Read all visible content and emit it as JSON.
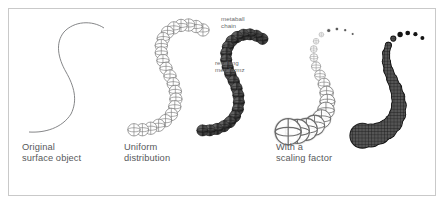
{
  "figure": {
    "background": "#ffffff",
    "border_color": "#c9c9c9",
    "ink": "#58595b",
    "dark_fill": "#3c3c3c",
    "halo": "#d8d8d8"
  },
  "captions": {
    "original": "Original\nsurface object",
    "uniform": "Uniform\ndistribution",
    "scaling": "With a\nscaling factor"
  },
  "annotations": {
    "chain": "metaball\nchain",
    "metaformz": "resulting\nmetaformz"
  },
  "panels": [
    {
      "id": "original",
      "caption": "Original\nsurface object",
      "content": "single open S-shaped curve, thin gray stroke, no spheres"
    },
    {
      "id": "uniform",
      "caption": "Uniform\ndistribution",
      "content": "two S-curves: left chain of equal-size wireframe spheres, right chain of equal-size dark mesh-filled metaballs merged into a blob",
      "annotations": [
        "metaball\nchain",
        "resulting\nmetaformz"
      ]
    },
    {
      "id": "scaling",
      "caption": "With a\nscaling factor",
      "content": "chain of wireframe spheres whose radius shrinks from bottom-left to top-right ending in tiny dots; resulting dark mesh metaform is thick at the bottom and tapers to small dots"
    }
  ],
  "chain_geometry": {
    "curve_path_points": [
      [
        104,
        28
      ],
      [
        92,
        22
      ],
      [
        76,
        22
      ],
      [
        64,
        30
      ],
      [
        58,
        44
      ],
      [
        58,
        60
      ],
      [
        64,
        74
      ],
      [
        72,
        86
      ],
      [
        76,
        100
      ],
      [
        72,
        114
      ],
      [
        60,
        126
      ],
      [
        44,
        132
      ],
      [
        30,
        132
      ]
    ],
    "uniform_sphere_radius_px": 6.2,
    "uniform_sphere_count": 22,
    "scaled_radius_range_px": [
      1.2,
      13.0
    ],
    "scaled_sphere_count": 19,
    "sphere_glyph": "circle with vertical meridian line and horizontal equator ellipse"
  },
  "icons": {
    "sphere_wireframe": "sphere-wireframe-icon",
    "metaball": "metaball-icon"
  }
}
